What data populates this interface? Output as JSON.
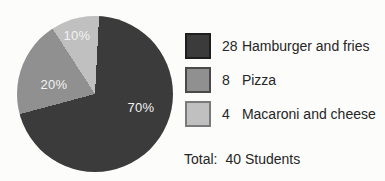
{
  "chart_data": {
    "type": "pie",
    "title": "",
    "categories": [
      "Hamburger and fries",
      "Pizza",
      "Macaroni and cheese"
    ],
    "values": [
      28,
      8,
      4
    ],
    "percent_labels": [
      "70%",
      "20%",
      "10%"
    ],
    "colors": [
      "#3b3b3b",
      "#909090",
      "#c0c0c0"
    ],
    "swatch_border_colors": [
      "#1e1e1e",
      "#4a4a4a",
      "#7a7a7a"
    ],
    "start_angle_deg": 3,
    "direction": "clockwise",
    "legend_position": "right",
    "total_label": "Total:",
    "total_value": "40 Students"
  },
  "legend": {
    "items": [
      {
        "count": "28",
        "label": "Hamburger and fries"
      },
      {
        "count": "8",
        "label": "Pizza"
      },
      {
        "count": "4",
        "label": "Macaroni and cheese"
      }
    ]
  },
  "total": {
    "label": "Total:",
    "value": "40 Students"
  }
}
